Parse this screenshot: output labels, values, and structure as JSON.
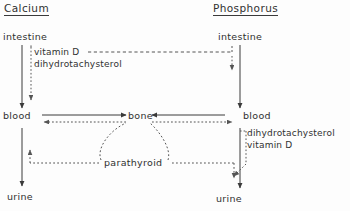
{
  "diagram": {
    "columns": [
      {
        "id": "calcium",
        "title": "Calcium"
      },
      {
        "id": "phosphorus",
        "title": "Phosphorus"
      }
    ],
    "nodes": {
      "calcium_intestine": "intestine",
      "calcium_blood": "blood",
      "calcium_urine": "urine",
      "bone": "bone",
      "phosphorus_intestine": "intestine",
      "phosphorus_blood": "blood",
      "phosphorus_urine": "urine",
      "parathyroid": "parathyroid"
    },
    "agents": {
      "left_vitamin_d": "vitamin D",
      "left_dihydrotachysterol": "dihydrotachysterol",
      "right_dihydrotachysterol": "dihydrotachysterol",
      "right_vitamin_d": "vitamin D"
    },
    "colors": {
      "stroke": "#3a3a3a",
      "dotted": "#555555",
      "text": "#303030",
      "background": "#fdfdfd"
    }
  }
}
